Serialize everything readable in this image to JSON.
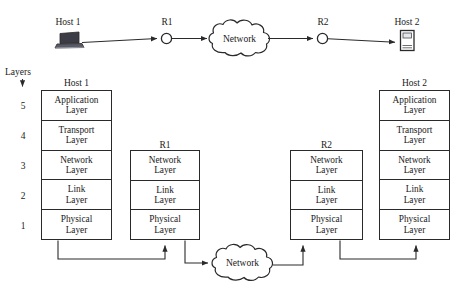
{
  "diagram": {
    "layers_caption": "Layers",
    "layer_numbers": [
      "5",
      "4",
      "3",
      "2",
      "1"
    ],
    "topology": {
      "nodes": [
        {
          "id": "host1",
          "label": "Host 1",
          "icon": "laptop-icon"
        },
        {
          "id": "r1",
          "label": "R1",
          "icon": "router-circle-icon"
        },
        {
          "id": "cloud_top",
          "label": "Network",
          "icon": "cloud-icon"
        },
        {
          "id": "r2",
          "label": "R2",
          "icon": "router-circle-icon"
        },
        {
          "id": "host2",
          "label": "Host 2",
          "icon": "server-icon"
        }
      ],
      "links": [
        {
          "from": "host1",
          "to": "r1"
        },
        {
          "from": "r1",
          "to": "cloud_top"
        },
        {
          "from": "cloud_top",
          "to": "r2"
        },
        {
          "from": "r2",
          "to": "host2"
        }
      ]
    },
    "stacks": [
      {
        "id": "host1-stack",
        "title": "Host 1",
        "layers": [
          {
            "line1": "Application",
            "line2": "Layer",
            "number": "5"
          },
          {
            "line1": "Transport",
            "line2": "Layer",
            "number": "4"
          },
          {
            "line1": "Network",
            "line2": "Layer",
            "number": "3"
          },
          {
            "line1": "Link",
            "line2": "Layer",
            "number": "2"
          },
          {
            "line1": "Physical",
            "line2": "Layer",
            "number": "1"
          }
        ]
      },
      {
        "id": "r1-stack",
        "title": "R1",
        "layers": [
          {
            "line1": "Network",
            "line2": "Layer",
            "number": "3"
          },
          {
            "line1": "Link",
            "line2": "Layer",
            "number": "2"
          },
          {
            "line1": "Physical",
            "line2": "Layer",
            "number": "1"
          }
        ]
      },
      {
        "id": "r2-stack",
        "title": "R2",
        "layers": [
          {
            "line1": "Network",
            "line2": "Layer",
            "number": "3"
          },
          {
            "line1": "Link",
            "line2": "Layer",
            "number": "2"
          },
          {
            "line1": "Physical",
            "line2": "Layer",
            "number": "1"
          }
        ]
      },
      {
        "id": "host2-stack",
        "title": "Host 2",
        "layers": [
          {
            "line1": "Application",
            "line2": "Layer",
            "number": "5"
          },
          {
            "line1": "Transport",
            "line2": "Layer",
            "number": "4"
          },
          {
            "line1": "Network",
            "line2": "Layer",
            "number": "3"
          },
          {
            "line1": "Link",
            "line2": "Layer",
            "number": "2"
          },
          {
            "line1": "Physical",
            "line2": "Layer",
            "number": "1"
          }
        ]
      }
    ],
    "bottom_cloud": {
      "label": "Network",
      "icon": "cloud-icon"
    },
    "colors": {
      "stroke": "#2a2a2a",
      "text": "#1a1a1a",
      "background": "#ffffff",
      "device_dark": "#3c3c46",
      "device_light": "#c9cdd4"
    }
  }
}
